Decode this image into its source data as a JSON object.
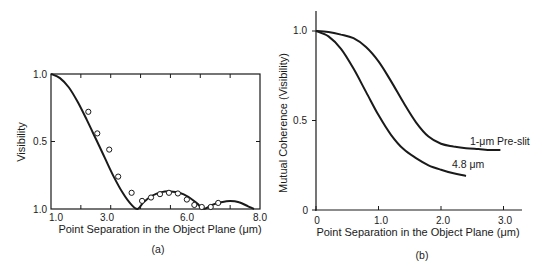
{
  "chart_data": [
    {
      "panel": "(a)",
      "type": "line",
      "title": "",
      "xlabel": "Point Separation in the Object Plane (μm)",
      "ylabel": "Visibility",
      "xlim": [
        1.0,
        8.0
      ],
      "ylim": [
        0.0,
        1.0
      ],
      "x_tick_labels": [
        "1.0",
        "3.0",
        "6.0",
        "8.0"
      ],
      "y_tick_labels": [
        "1.0",
        "0.5",
        "1.0"
      ],
      "grid": false,
      "legend": null,
      "series": [
        {
          "name": "theory",
          "style": "solid-line",
          "x": [
            1.0,
            1.3,
            1.6,
            1.9,
            2.2,
            2.5,
            2.8,
            3.1,
            3.4,
            3.7,
            3.9,
            4.1,
            4.4,
            4.7,
            5.0,
            5.3,
            5.6,
            5.9,
            6.1,
            6.4,
            6.7,
            7.0,
            7.3,
            7.6,
            7.8
          ],
          "y": [
            1.0,
            0.97,
            0.9,
            0.79,
            0.66,
            0.52,
            0.38,
            0.24,
            0.12,
            0.03,
            0.0,
            0.05,
            0.1,
            0.125,
            0.13,
            0.12,
            0.09,
            0.04,
            0.0,
            0.03,
            0.05,
            0.06,
            0.05,
            0.02,
            0.0
          ]
        },
        {
          "name": "measured",
          "style": "open-circles",
          "x": [
            2.25,
            2.55,
            2.95,
            3.25,
            3.7,
            4.05,
            4.35,
            4.65,
            4.95,
            5.25,
            5.55,
            5.8,
            6.05,
            6.35,
            6.6
          ],
          "y": [
            0.72,
            0.56,
            0.44,
            0.24,
            0.12,
            0.06,
            0.085,
            0.11,
            0.12,
            0.115,
            0.07,
            0.03,
            0.015,
            0.015,
            0.045
          ]
        }
      ]
    },
    {
      "panel": "(b)",
      "type": "line",
      "title": "",
      "xlabel": "Point Separation in the Object Plane (μm)",
      "ylabel": "Mutual Coherence (Visibility)",
      "xlim": [
        0,
        3.3
      ],
      "ylim": [
        0,
        1.1
      ],
      "x_tick_labels": [
        "0",
        "1.0",
        "2.0",
        "3.0"
      ],
      "y_tick_labels": [
        "0",
        "0.5",
        "1.0"
      ],
      "grid": false,
      "legend": null,
      "series": [
        {
          "name": "1-μm Pre-slit",
          "x": [
            0,
            0.2,
            0.4,
            0.6,
            0.8,
            1.0,
            1.2,
            1.4,
            1.6,
            1.8,
            2.0,
            2.2,
            2.4,
            2.6,
            2.8,
            2.95
          ],
          "y": [
            1.0,
            0.995,
            0.98,
            0.96,
            0.91,
            0.83,
            0.72,
            0.6,
            0.49,
            0.41,
            0.37,
            0.355,
            0.345,
            0.34,
            0.335,
            0.335
          ]
        },
        {
          "name": "4.8 μm",
          "x": [
            0,
            0.2,
            0.4,
            0.6,
            0.8,
            1.0,
            1.2,
            1.4,
            1.6,
            1.8,
            2.0,
            2.2,
            2.4
          ],
          "y": [
            1.0,
            0.97,
            0.9,
            0.79,
            0.66,
            0.53,
            0.42,
            0.34,
            0.29,
            0.25,
            0.225,
            0.205,
            0.19
          ]
        }
      ]
    }
  ],
  "panels": {
    "a": {
      "label": "(a)",
      "xlabel": "Point Separation in the Object Plane (μm)",
      "ylabel": "Visibility",
      "xticks": [
        "1.0",
        "3.0",
        "6.0",
        "8.0"
      ],
      "yticks": [
        "1.0",
        "0.5",
        "1.0"
      ]
    },
    "b": {
      "label": "(b)",
      "xlabel": "Point Separation in the Object Plane (μm)",
      "ylabel": "Mutual Coherence (Visibility)",
      "xticks": [
        "0",
        "1.0",
        "2.0",
        "3.0"
      ],
      "yticks": [
        "0",
        "0.5",
        "1.0"
      ],
      "series_labels": [
        "1-μm Pre-slit",
        "4.8 μm"
      ]
    }
  }
}
